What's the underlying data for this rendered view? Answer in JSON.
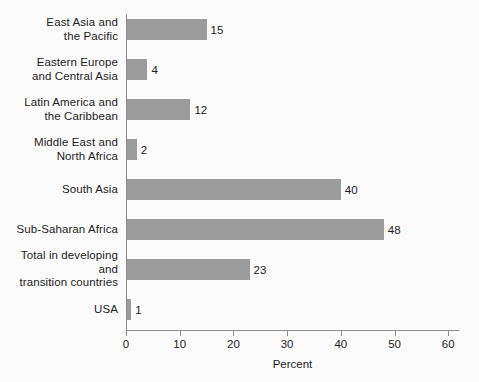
{
  "chart_data": {
    "type": "bar",
    "orientation": "horizontal",
    "title": "",
    "xlabel": "Percent",
    "ylabel": "",
    "categories": [
      "East Asia and\nthe Pacific",
      "Eastern Europe\nand Central Asia",
      "Latin America and\nthe Caribbean",
      "Middle East and\nNorth Africa",
      "South Asia",
      "Sub-Saharan Africa",
      "Total in developing and\ntransition countries",
      "USA"
    ],
    "values": [
      15,
      4,
      12,
      2,
      40,
      48,
      23,
      1
    ],
    "value_labels": [
      "15",
      "4",
      "12",
      "2",
      "40",
      "48",
      "23",
      "1"
    ],
    "xlim": [
      0,
      62
    ],
    "xticks": [
      0,
      10,
      20,
      30,
      40,
      50,
      60
    ],
    "xtick_labels": [
      "0",
      "10",
      "20",
      "30",
      "40",
      "50",
      "60"
    ],
    "grid": false,
    "legend": null,
    "bar_color": "#9b9b9b",
    "axis_color": "#8d8d8d",
    "background_color": "#fbfbfb",
    "text_color": "#1d1d1d"
  }
}
